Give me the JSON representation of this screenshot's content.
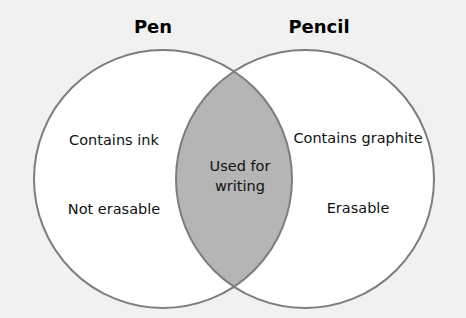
{
  "diagram": {
    "type": "venn",
    "sets": [
      {
        "title": "Pen",
        "items": [
          "Contains ink",
          "Not erasable"
        ]
      },
      {
        "title": "Pencil",
        "items": [
          "Contains graphite",
          "Erasable"
        ]
      }
    ],
    "intersection": {
      "line1": "Used for",
      "line2": "writing"
    },
    "colors": {
      "background": "#f1f1f0",
      "circle_fill": "#ffffff",
      "circle_stroke": "#7d7d7d",
      "intersection_fill": "#b5b5b5"
    }
  }
}
